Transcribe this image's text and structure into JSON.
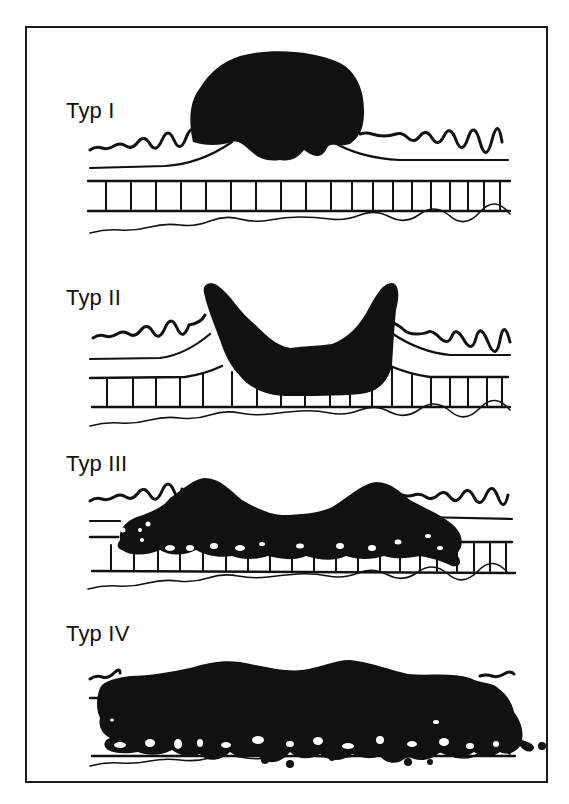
{
  "figure": {
    "background": "#ffffff",
    "ink": "#111111",
    "panels": [
      {
        "id": "typ1",
        "label": "Typ I",
        "label_pos": [
          66,
          100
        ]
      },
      {
        "id": "typ2",
        "label": "Typ II",
        "label_pos": [
          66,
          287
        ]
      },
      {
        "id": "typ3",
        "label": "Typ III",
        "label_pos": [
          66,
          453
        ]
      },
      {
        "id": "typ4",
        "label": "Typ IV",
        "label_pos": [
          66,
          623
        ]
      }
    ]
  }
}
